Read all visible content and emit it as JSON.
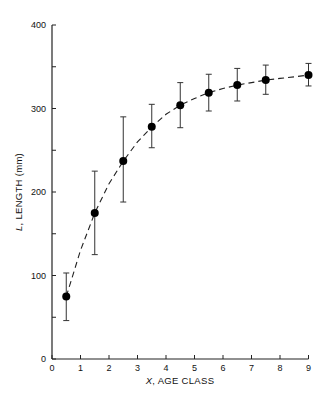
{
  "chart_data": {
    "type": "scatter",
    "title": "",
    "xlabel": "X, AGE CLASS",
    "xlabel_var": "X",
    "xlabel_text": ", AGE CLASS",
    "ylabel": "L, LENGTH (mm)",
    "ylabel_var": "L",
    "ylabel_text": ", LENGTH (mm)",
    "xlim": [
      0,
      9
    ],
    "ylim": [
      0,
      400
    ],
    "x_ticks": [
      0,
      1,
      2,
      3,
      4,
      5,
      6,
      7,
      8,
      9
    ],
    "y_ticks": [
      0,
      100,
      200,
      300,
      400
    ],
    "y_minor_ticks": [
      50,
      150,
      250,
      350
    ],
    "grid": false,
    "legend": null,
    "series": [
      {
        "name": "Observed mean length with error bars",
        "marker": "filled-circle",
        "x": [
          0.5,
          1.5,
          2.5,
          3.5,
          4.5,
          5.5,
          6.5,
          7.5,
          9.0
        ],
        "y": [
          75,
          175,
          237,
          278,
          304,
          319,
          328,
          334,
          340
        ],
        "error_upper": [
          103,
          225,
          290,
          305,
          331,
          341,
          348,
          352,
          354
        ],
        "error_lower": [
          46,
          125,
          188,
          253,
          277,
          297,
          309,
          317,
          327
        ]
      },
      {
        "name": "Fitted growth curve",
        "style": "dashed",
        "x": [
          0.5,
          1.0,
          1.5,
          2.0,
          2.5,
          3.0,
          3.5,
          4.0,
          4.5,
          5.0,
          5.5,
          6.0,
          6.5,
          7.0,
          7.5,
          8.0,
          8.5,
          9.0
        ],
        "y": [
          75,
          130,
          175,
          210,
          237,
          260,
          278,
          293,
          304,
          312,
          319,
          324,
          328,
          331,
          334,
          336,
          338,
          340
        ]
      }
    ]
  }
}
